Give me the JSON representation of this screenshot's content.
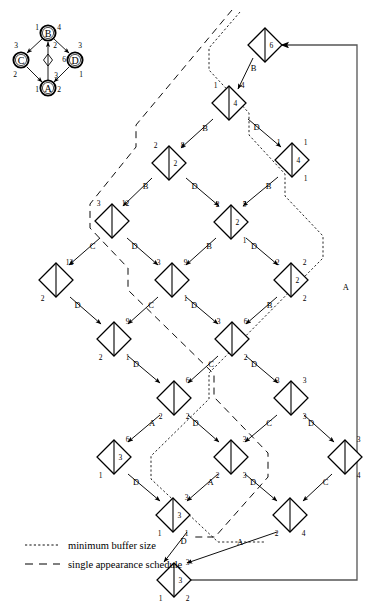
{
  "figure": {
    "apgraph": {
      "title": "application-graph",
      "nodes": [
        {
          "name": "B",
          "label": "B",
          "cx": 48,
          "cy": 33,
          "left": "1",
          "right": "4"
        },
        {
          "name": "C",
          "label": "C",
          "cx": 21,
          "cy": 60,
          "left": "3",
          "right": "2"
        },
        {
          "name": "D",
          "label": "D",
          "cx": 75,
          "cy": 60,
          "left": "3",
          "right": "1"
        },
        {
          "name": "A",
          "label": "A",
          "cx": 48,
          "cy": 88,
          "left": "1",
          "right": "2"
        }
      ],
      "delay": {
        "name": "delay-diamond",
        "cx": 48,
        "cy": 60,
        "label": "6"
      },
      "edge_labels": [
        {
          "name": "edge-A-B",
          "label": "2",
          "x": 54,
          "y": 47
        },
        {
          "name": "edge-delay-A",
          "label": "3",
          "x": 54,
          "y": 77
        }
      ]
    },
    "legend": [
      {
        "name": "legend-minimum-buffer-size",
        "style": "dotted",
        "label": "minimum buffer size"
      },
      {
        "name": "legend-single-appearance-schedule",
        "style": "dashed",
        "label": "single appearance schedule"
      }
    ],
    "feedback_label": "A",
    "tree_nodes": [
      {
        "id": "n-6",
        "cx": 265,
        "cy": 45,
        "tl": "",
        "tr": "",
        "bl": "",
        "br": "",
        "c": "6"
      },
      {
        "id": "n-4a",
        "cx": 229,
        "cy": 103,
        "tl": "1",
        "tr": "4",
        "bl": "",
        "br": "",
        "c": "4"
      },
      {
        "id": "n-4b",
        "cx": 292,
        "cy": 160,
        "tl": "1",
        "tr": "1",
        "bl": "",
        "br": "1",
        "c": "4"
      },
      {
        "id": "n-2a",
        "cx": 169,
        "cy": 163,
        "tl": "2",
        "tr": "8",
        "bl": "",
        "br": "",
        "c": "2"
      },
      {
        "id": "n-12a",
        "cx": 112,
        "cy": 221,
        "tl": "3",
        "tr": "12",
        "bl": "",
        "br": "",
        "c": ""
      },
      {
        "id": "n-2b",
        "cx": 231,
        "cy": 222,
        "tl": "2",
        "tr": "5",
        "bl": "",
        "br": "1",
        "c": "2"
      },
      {
        "id": "n-12b",
        "cx": 56,
        "cy": 280,
        "tl": "",
        "tr": "12",
        "bl": "2",
        "br": "",
        "c": ""
      },
      {
        "id": "n-9",
        "cx": 172,
        "cy": 280,
        "tl": "3",
        "tr": "9",
        "bl": "",
        "br": "1",
        "c": ""
      },
      {
        "id": "n-2c",
        "cx": 291,
        "cy": 280,
        "tl": "2",
        "tr": "2",
        "bl": "",
        "br": "2",
        "c": "2"
      },
      {
        "id": "n-9b",
        "cx": 114,
        "cy": 339,
        "tl": "",
        "tr": "9",
        "bl": "2",
        "br": "1",
        "c": ""
      },
      {
        "id": "n-6b",
        "cx": 232,
        "cy": 339,
        "tl": "3",
        "tr": "6",
        "bl": "",
        "br": "2",
        "c": ""
      },
      {
        "id": "n-3a",
        "cx": 174,
        "cy": 398,
        "tl": "",
        "tr": "6",
        "bl": "2",
        "br": "2",
        "c": ""
      },
      {
        "id": "n-3b",
        "cx": 291,
        "cy": 398,
        "tl": "3",
        "tr": "3",
        "bl": "",
        "br": "3",
        "c": ""
      },
      {
        "id": "n-3c",
        "cx": 114,
        "cy": 457,
        "tl": "",
        "tr": "6",
        "bl": "1",
        "br": "",
        "c": "3"
      },
      {
        "id": "n-3d",
        "cx": 231,
        "cy": 457,
        "tl": "",
        "tr": "3",
        "bl": "2",
        "br": "3",
        "c": ""
      },
      {
        "id": "n-3e",
        "cx": 345,
        "cy": 457,
        "tl": "",
        "tr": "3",
        "bl": "",
        "br": "4",
        "c": ""
      },
      {
        "id": "n-3f",
        "cx": 173,
        "cy": 515,
        "tl": "",
        "tr": "3",
        "bl": "1",
        "br": "1",
        "c": "3"
      },
      {
        "id": "n-2d",
        "cx": 290,
        "cy": 515,
        "tl": "",
        "tr": "",
        "bl": "2",
        "br": "4",
        "c": ""
      },
      {
        "id": "n-3g",
        "cx": 174,
        "cy": 580,
        "tl": "",
        "tr": "3",
        "bl": "1",
        "br": "2",
        "c": "3"
      }
    ],
    "tree_edges": [
      {
        "name": "edge-B-1",
        "label": "B",
        "x1": 253,
        "y1": 58,
        "x2": 238,
        "y2": 89
      },
      {
        "name": "edge-D-1",
        "label": "D",
        "x1": 248,
        "y1": 119,
        "x2": 281,
        "y2": 147
      },
      {
        "name": "edge-B-2",
        "label": "B",
        "x1": 213,
        "y1": 119,
        "x2": 181,
        "y2": 148
      },
      {
        "name": "edge-B-3",
        "label": "B",
        "x1": 278,
        "y1": 177,
        "x2": 243,
        "y2": 206
      },
      {
        "name": "edge-B-4",
        "label": "B",
        "x1": 152,
        "y1": 178,
        "x2": 123,
        "y2": 206
      },
      {
        "name": "edge-D-2",
        "label": "D",
        "x1": 186,
        "y1": 178,
        "x2": 219,
        "y2": 206
      },
      {
        "name": "edge-C-1",
        "label": "C",
        "x1": 100,
        "y1": 238,
        "x2": 69,
        "y2": 265
      },
      {
        "name": "edge-D-3",
        "label": "D",
        "x1": 127,
        "y1": 238,
        "x2": 158,
        "y2": 265
      },
      {
        "name": "edge-B-5",
        "label": "B",
        "x1": 216,
        "y1": 238,
        "x2": 186,
        "y2": 265
      },
      {
        "name": "edge-D-4",
        "label": "D",
        "x1": 246,
        "y1": 238,
        "x2": 278,
        "y2": 265
      },
      {
        "name": "edge-D-5",
        "label": "D",
        "x1": 70,
        "y1": 297,
        "x2": 101,
        "y2": 324
      },
      {
        "name": "edge-C-2",
        "label": "C",
        "x1": 158,
        "y1": 297,
        "x2": 128,
        "y2": 324
      },
      {
        "name": "edge-D-6",
        "label": "D",
        "x1": 186,
        "y1": 297,
        "x2": 218,
        "y2": 324
      },
      {
        "name": "edge-B-6",
        "label": "B",
        "x1": 277,
        "y1": 297,
        "x2": 246,
        "y2": 324
      },
      {
        "name": "edge-D-7",
        "label": "D",
        "x1": 128,
        "y1": 356,
        "x2": 160,
        "y2": 383
      },
      {
        "name": "edge-C-3",
        "label": "C",
        "x1": 218,
        "y1": 356,
        "x2": 188,
        "y2": 383
      },
      {
        "name": "edge-D-8",
        "label": "D",
        "x1": 246,
        "y1": 356,
        "x2": 278,
        "y2": 383
      },
      {
        "name": "edge-A-1",
        "label": "A",
        "x1": 160,
        "y1": 415,
        "x2": 128,
        "y2": 442
      },
      {
        "name": "edge-D-9",
        "label": "D",
        "x1": 188,
        "y1": 415,
        "x2": 219,
        "y2": 442
      },
      {
        "name": "edge-C-4",
        "label": "C",
        "x1": 277,
        "y1": 415,
        "x2": 245,
        "y2": 442
      },
      {
        "name": "edge-D-10",
        "label": "D",
        "x1": 304,
        "y1": 415,
        "x2": 334,
        "y2": 442
      },
      {
        "name": "edge-D-11",
        "label": "D",
        "x1": 128,
        "y1": 474,
        "x2": 160,
        "y2": 501
      },
      {
        "name": "edge-A-2",
        "label": "A",
        "x1": 218,
        "y1": 474,
        "x2": 187,
        "y2": 501
      },
      {
        "name": "edge-D-12",
        "label": "D",
        "x1": 245,
        "y1": 474,
        "x2": 277,
        "y2": 501
      },
      {
        "name": "edge-C-5",
        "label": "C",
        "x1": 332,
        "y1": 474,
        "x2": 303,
        "y2": 501
      },
      {
        "name": "edge-D-13",
        "label": "D",
        "x1": 187,
        "y1": 532,
        "x2": 164,
        "y2": 562
      },
      {
        "name": "edge-A-3",
        "label": "A",
        "x1": 277,
        "y1": 532,
        "x2": 187,
        "y2": 563
      }
    ]
  }
}
